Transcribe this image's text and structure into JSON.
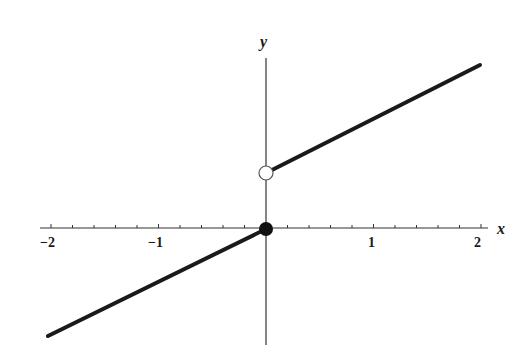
{
  "chart_data": {
    "type": "line",
    "title": "",
    "xlabel": "x",
    "ylabel": "y",
    "xlim": [
      -2,
      2
    ],
    "x_ticks": [
      -2,
      -1,
      1,
      2
    ],
    "x_tick_labels": [
      "−2",
      "−1",
      "1",
      "2"
    ],
    "minor_tick_step": 0.2,
    "grid": false,
    "series": [
      {
        "name": "left piece",
        "x": [
          -2,
          0
        ],
        "y": [
          -1,
          0
        ],
        "endpoint_right": "closed"
      },
      {
        "name": "right piece",
        "x": [
          0,
          2
        ],
        "y": [
          0.5,
          1.5
        ],
        "endpoint_left": "open"
      }
    ],
    "markers": [
      {
        "x": 0,
        "y": 0,
        "style": "filled"
      },
      {
        "x": 0,
        "y": 0.5,
        "style": "open"
      }
    ],
    "colors": {
      "line": "#1a1a1a",
      "axis": "#333333"
    }
  },
  "labels": {
    "x_axis": "x",
    "y_axis": "y",
    "tick_m2": "−2",
    "tick_m1": "−1",
    "tick_1": "1",
    "tick_2": "2"
  }
}
